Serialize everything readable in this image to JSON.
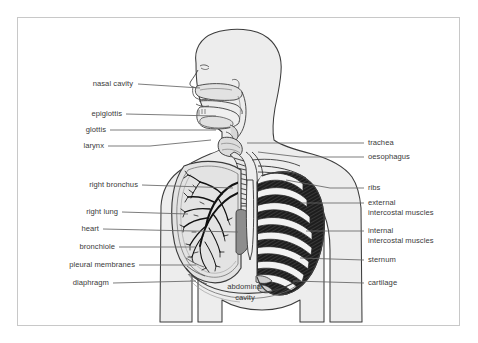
{
  "figure": {
    "frame_color": "#c8c8c8",
    "background": "#ffffff",
    "text_color": "#3a3a3a",
    "body_fill": "#ededed",
    "lung_fill": "#e3e3e3",
    "heart_fill": "#8d8d8d",
    "rib_fill": "#f2f2f2",
    "intercostal_fill": "#1d1d1d",
    "outline_color": "#3c3c3c"
  },
  "labels": {
    "left": [
      {
        "text": "nasal cavity",
        "x": 133,
        "y": 84,
        "line_to_x": 200,
        "line_to_y": 88
      },
      {
        "text": "epiglottis",
        "x": 133,
        "y": 114,
        "line_to_x": 216,
        "line_to_y": 116
      },
      {
        "text": "glottis",
        "x": 133,
        "y": 130,
        "line_to_x": 216,
        "line_to_y": 130
      },
      {
        "text": "larynx",
        "x": 133,
        "y": 146,
        "line_to_x": 211,
        "line_to_y": 140
      },
      {
        "text": "right bronchus",
        "x": 133,
        "y": 185,
        "line_to_x": 233,
        "line_to_y": 188
      },
      {
        "text": "right lung",
        "x": 133,
        "y": 212,
        "line_to_x": 188,
        "line_to_y": 214
      },
      {
        "text": "heart",
        "x": 133,
        "y": 229,
        "line_to_x": 238,
        "line_to_y": 232
      },
      {
        "text": "bronchiole",
        "x": 133,
        "y": 247,
        "line_to_x": 195,
        "line_to_y": 247
      },
      {
        "text": "pleural membranes",
        "x": 133,
        "y": 265,
        "line_to_x": 196,
        "line_to_y": 265
      },
      {
        "text": "diaphragm",
        "x": 133,
        "y": 283,
        "line_to_x": 196,
        "line_to_y": 281
      }
    ],
    "right": [
      {
        "text": "trachea",
        "x": 368,
        "y": 143,
        "line_from_x": 247,
        "line_from_y": 143,
        "lines": [
          "trachea"
        ]
      },
      {
        "text": "oesophagus",
        "x": 368,
        "y": 157,
        "line_from_x": 258,
        "line_from_y": 152,
        "lines": [
          "oesophagus"
        ]
      },
      {
        "text": "ribs",
        "x": 368,
        "y": 188,
        "line_from_x": 286,
        "line_from_y": 180,
        "lines": [
          "ribs"
        ]
      },
      {
        "text": "external intercostal muscles",
        "x": 368,
        "y": 205,
        "line_from_x": 300,
        "line_from_y": 203,
        "lines": [
          "external",
          "intercostal muscles"
        ]
      },
      {
        "text": "internal intercostal muscles",
        "x": 368,
        "y": 233,
        "line_from_x": 306,
        "line_from_y": 231,
        "lines": [
          "internal",
          "intercostal muscles"
        ]
      },
      {
        "text": "sternum",
        "x": 368,
        "y": 261,
        "line_from_x": 300,
        "line_from_y": 258,
        "lines": [
          "sternum"
        ]
      },
      {
        "text": "cartilage",
        "x": 368,
        "y": 284,
        "line_from_x": 293,
        "line_from_y": 281,
        "lines": [
          "cartilage"
        ]
      }
    ],
    "center": [
      {
        "text": "abdominal cavity",
        "x": 245,
        "y": 292,
        "lines": [
          "abdominal",
          "cavity"
        ]
      }
    ]
  }
}
